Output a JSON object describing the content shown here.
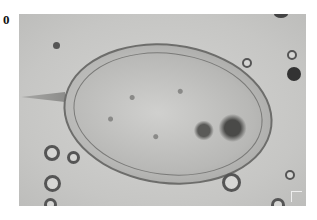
{
  "panel": {
    "label": "0",
    "description": "Grayscale light micrograph of an oval parasite egg with a terminal spine, surrounded by small round bubbles/particles"
  }
}
